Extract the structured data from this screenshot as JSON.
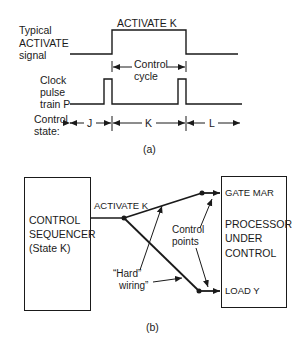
{
  "part_a": {
    "caption": "(a)",
    "activate_signal": {
      "label_line1": "Typical",
      "label_line2": "ACTIVATE",
      "label_line3": "signal",
      "pulse_label": "ACTIVATE K"
    },
    "control_cycle": {
      "line1": "Control",
      "line2": "cycle"
    },
    "clock": {
      "line1": "Clock",
      "line2": "pulse",
      "line3": "train P"
    },
    "control_state": {
      "label_line1": "Control",
      "label_line2": "state:",
      "states": [
        "J",
        "K",
        "L"
      ]
    }
  },
  "part_b": {
    "caption": "(b)",
    "sequencer": {
      "line1": "CONTROL",
      "line2": "SEQUENCER",
      "line3": "(State K)"
    },
    "signal_label": "ACTIVATE K",
    "processor": {
      "line1": "PROCESSOR",
      "line2": "UNDER",
      "line3": "CONTROL"
    },
    "control_points": [
      "GATE MAR",
      "LOAD Y"
    ],
    "annotation_control_points": {
      "line1": "Control",
      "line2": "points"
    },
    "annotation_hard_wiring": {
      "line1": "“Hard”",
      "line2": "wiring”"
    }
  },
  "colors": {
    "ink": "#1a1a1a",
    "background": "#ffffff"
  }
}
